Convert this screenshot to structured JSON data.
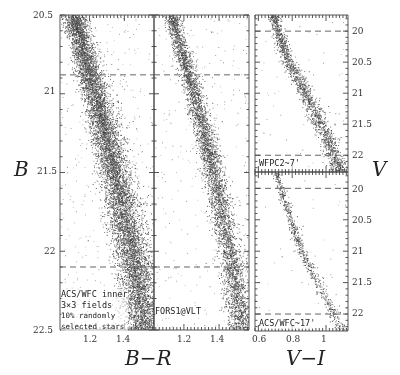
{
  "chart_data": [
    {
      "type": "scatter",
      "panel": "left",
      "title": "",
      "xlabel": "B−R",
      "ylabel": "B",
      "xlim": [
        1.03,
        1.57
      ],
      "ylim": [
        22.5,
        20.5
      ],
      "xticks": [
        1.2,
        1.4
      ],
      "yticks": [
        20.5,
        21,
        21.5,
        22,
        22.5
      ],
      "annotation": [
        "ACS/WFC inner",
        "3×3 fields",
        "10% randomly",
        "selected stars"
      ],
      "dashed_lines_y": [
        20.88,
        22.1
      ],
      "sequence": {
        "points": [
          [
            1.1,
            20.5
          ],
          [
            1.22,
            21.0
          ],
          [
            1.33,
            21.5
          ],
          [
            1.43,
            22.0
          ],
          [
            1.5,
            22.5
          ]
        ],
        "width": 0.09,
        "density": "very high"
      }
    },
    {
      "type": "scatter",
      "panel": "middle",
      "title": "",
      "xlabel": "B−R",
      "ylabel": "B",
      "xlim": [
        1.03,
        1.57
      ],
      "ylim": [
        22.5,
        20.5
      ],
      "xticks": [
        1.2,
        1.4
      ],
      "annotation": [
        "FORS1@VLT"
      ],
      "dashed_lines_y": [
        20.88,
        22.1
      ],
      "sequence": {
        "points": [
          [
            1.12,
            20.5
          ],
          [
            1.25,
            21.0
          ],
          [
            1.36,
            21.5
          ],
          [
            1.45,
            22.0
          ],
          [
            1.52,
            22.5
          ]
        ],
        "width": 0.06,
        "density": "high"
      }
    },
    {
      "type": "scatter",
      "panel": "right-top",
      "xlabel": "",
      "ylabel": "V",
      "xlim": [
        0.58,
        1.13
      ],
      "ylim": [
        22.27,
        19.74
      ],
      "yticks": [
        20,
        20.5,
        21,
        21.5,
        22
      ],
      "annotation": [
        "WFPC2~7'"
      ],
      "dashed_lines_y": [
        20.0,
        22.0
      ],
      "sequence": {
        "points": [
          [
            0.68,
            19.74
          ],
          [
            0.77,
            20.5
          ],
          [
            0.87,
            21.0
          ],
          [
            0.96,
            21.5
          ],
          [
            1.04,
            22.0
          ],
          [
            1.08,
            22.27
          ]
        ],
        "width": 0.045,
        "density": "medium"
      }
    },
    {
      "type": "scatter",
      "panel": "right-bottom",
      "xlabel": "V−I",
      "ylabel": "V",
      "xlim": [
        0.58,
        1.13
      ],
      "ylim": [
        22.27,
        19.74
      ],
      "xticks": [
        0.6,
        0.8,
        1
      ],
      "yticks": [
        20,
        20.5,
        21,
        21.5,
        22
      ],
      "annotation": [
        "ACS/WFC~17'"
      ],
      "dashed_lines_y": [
        20.0,
        22.0
      ],
      "sequence": {
        "points": [
          [
            0.7,
            19.74
          ],
          [
            0.76,
            20.3
          ],
          [
            0.85,
            21.0
          ],
          [
            0.95,
            21.5
          ],
          [
            1.04,
            22.0
          ],
          [
            1.09,
            22.27
          ]
        ],
        "width": 0.03,
        "density": "low"
      }
    }
  ],
  "labels": {
    "y_left": "B",
    "y_right": "V",
    "x_left": "B−R",
    "x_right": "V−I",
    "left_yticks": [
      "20.5",
      "21",
      "21.5",
      "22",
      "22.5"
    ],
    "left_xticks": [
      "1.2",
      "1.4"
    ],
    "mid_xticks": [
      "1.2",
      "1.4"
    ],
    "right_top_yticks": [
      "20",
      "20.5",
      "21",
      "21.5",
      "22"
    ],
    "right_bot_yticks": [
      "20",
      "20.5",
      "21",
      "21.5",
      "22"
    ],
    "right_xticks": [
      "0.6",
      "0.8",
      "1"
    ],
    "note_left": [
      "ACS/WFC inner",
      "3×3 fields",
      "10% randomly",
      "selected stars"
    ],
    "note_mid": "FORS1@VLT",
    "note_rt": "WFPC2~7'",
    "note_rb": "ACS/WFC~17'"
  },
  "render": {
    "star_counts": [
      9000,
      4800,
      1700,
      700
    ],
    "field_counts": [
      350,
      300,
      60,
      40
    ]
  }
}
